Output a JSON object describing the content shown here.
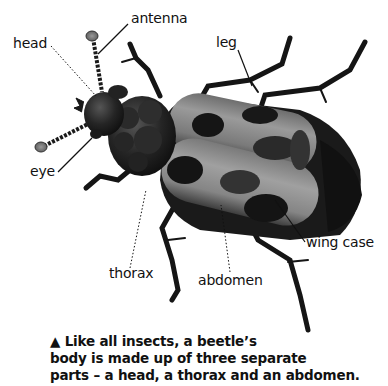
{
  "diagram": {
    "subject": "beetle",
    "labels": {
      "antenna": "antenna",
      "head": "head",
      "leg": "leg",
      "eye": "eye",
      "thorax": "thorax",
      "abdomen": "abdomen",
      "wing_case": "wing case"
    },
    "colors": {
      "body_dark": "#1c1c1c",
      "wing_light": "#8a8a8a",
      "wing_mid": "#5a5a5a",
      "wing_spot": "#141414",
      "antenna_tip": "#7a7a7a",
      "label_text": "#111111"
    }
  },
  "caption": {
    "icon": "triangle-up-icon",
    "marker": "▲",
    "lines": [
      "Like all insects, a beetle’s",
      "body is made up of three separate",
      "parts – a head, a thorax and an abdomen."
    ]
  }
}
